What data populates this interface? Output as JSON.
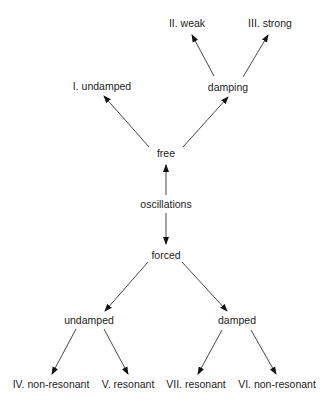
{
  "diagram": {
    "type": "tree",
    "root": "oscillations",
    "nodes": [
      {
        "id": "oscillations",
        "label": "oscillations",
        "x": 166,
        "y": 204
      },
      {
        "id": "free",
        "label": "free",
        "x": 166,
        "y": 153
      },
      {
        "id": "forced",
        "label": "forced",
        "x": 166,
        "y": 255
      },
      {
        "id": "i_undamped",
        "label": "I. undamped",
        "x": 102,
        "y": 86
      },
      {
        "id": "damping",
        "label": "damping",
        "x": 228,
        "y": 87
      },
      {
        "id": "ii_weak",
        "label": "II. weak",
        "x": 187,
        "y": 23
      },
      {
        "id": "iii_strong",
        "label": "III. strong",
        "x": 270,
        "y": 23
      },
      {
        "id": "undamped",
        "label": "undamped",
        "x": 89,
        "y": 320
      },
      {
        "id": "damped",
        "label": "damped",
        "x": 237,
        "y": 320
      },
      {
        "id": "iv_non_resonant",
        "label": "IV. non-resonant",
        "x": 51,
        "y": 384
      },
      {
        "id": "v_resonant",
        "label": "V. resonant",
        "x": 128,
        "y": 384
      },
      {
        "id": "vii_resonant",
        "label": "VII. resonant",
        "x": 196,
        "y": 384
      },
      {
        "id": "vi_non_resonant",
        "label": "VI. non-resonant",
        "x": 277,
        "y": 384
      }
    ],
    "edges": [
      {
        "from": "oscillations",
        "to": "free",
        "x1": 166,
        "y1": 195,
        "x2": 166,
        "y2": 165
      },
      {
        "from": "oscillations",
        "to": "forced",
        "x1": 166,
        "y1": 213,
        "x2": 166,
        "y2": 244
      },
      {
        "from": "free",
        "to": "i_undamped",
        "x1": 149,
        "y1": 147,
        "x2": 104,
        "y2": 96
      },
      {
        "from": "free",
        "to": "damping",
        "x1": 183,
        "y1": 147,
        "x2": 228,
        "y2": 97
      },
      {
        "from": "damping",
        "to": "ii_weak",
        "x1": 214,
        "y1": 76,
        "x2": 192,
        "y2": 35
      },
      {
        "from": "damping",
        "to": "iii_strong",
        "x1": 243,
        "y1": 77,
        "x2": 268,
        "y2": 35
      },
      {
        "from": "forced",
        "to": "undamped",
        "x1": 148,
        "y1": 262,
        "x2": 105,
        "y2": 311
      },
      {
        "from": "forced",
        "to": "damped",
        "x1": 182,
        "y1": 262,
        "x2": 227,
        "y2": 311
      },
      {
        "from": "undamped",
        "to": "iv_non_resonant",
        "x1": 76,
        "y1": 329,
        "x2": 52,
        "y2": 374
      },
      {
        "from": "undamped",
        "to": "v_resonant",
        "x1": 104,
        "y1": 329,
        "x2": 128,
        "y2": 374
      },
      {
        "from": "damped",
        "to": "vii_resonant",
        "x1": 222,
        "y1": 330,
        "x2": 198,
        "y2": 374
      },
      {
        "from": "damped",
        "to": "vi_non_resonant",
        "x1": 251,
        "y1": 330,
        "x2": 276,
        "y2": 374
      }
    ],
    "colors": {
      "line": "#333333",
      "text": "#222222",
      "background": "#ffffff"
    }
  }
}
